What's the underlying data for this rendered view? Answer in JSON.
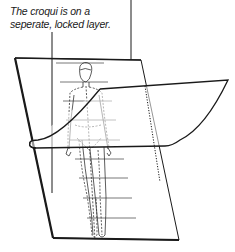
{
  "annotations": {
    "top_caption_cut": "",
    "left_caption": {
      "line1": "The croqui is on a",
      "line2": "seperate, locked layer."
    }
  },
  "diagram": {
    "elements": [
      "back-layer-sheet",
      "croqui-figure",
      "horizontal-guide-lines",
      "curled-overlay-sheet",
      "dotted-fold-line",
      "pointer-lines"
    ],
    "colors": {
      "ink": "#1a1a1a",
      "background": "#ffffff"
    }
  }
}
